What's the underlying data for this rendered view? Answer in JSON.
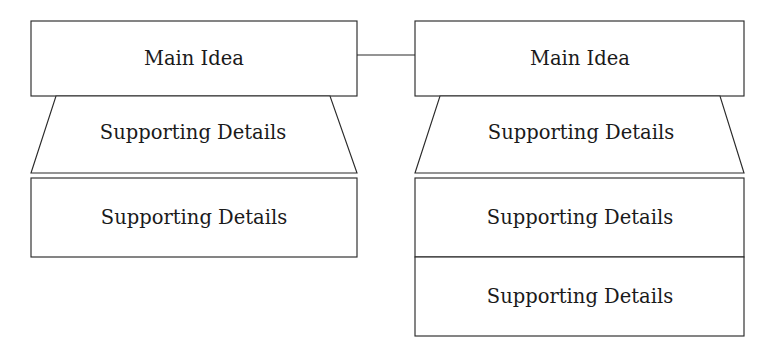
{
  "diagram": {
    "kind": "graphic-organizer",
    "colors": {
      "background": "#ffffff",
      "stroke": "#2b2b2b",
      "text": "#1a1a1a",
      "fill": "#ffffff"
    },
    "groups": [
      {
        "id": "left",
        "main_idea": {
          "label": "Main Idea"
        },
        "details": [
          {
            "label": "Supporting Details",
            "shape": "trapezoid"
          },
          {
            "label": "Supporting Details",
            "shape": "rectangle"
          }
        ]
      },
      {
        "id": "right",
        "main_idea": {
          "label": "Main Idea"
        },
        "details": [
          {
            "label": "Supporting Details",
            "shape": "trapezoid"
          },
          {
            "label": "Supporting Details",
            "shape": "rectangle"
          },
          {
            "label": "Supporting Details",
            "shape": "rectangle"
          }
        ]
      }
    ],
    "connector": {
      "label": "",
      "from": "left-main-idea",
      "to": "right-main-idea"
    }
  }
}
